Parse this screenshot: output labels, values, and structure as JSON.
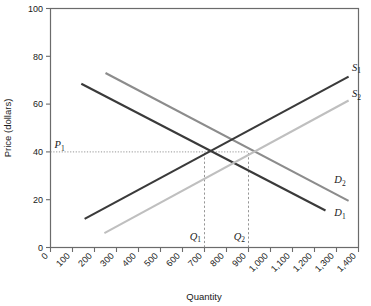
{
  "chart_data": {
    "type": "line",
    "title": "",
    "xlabel": "Quantity",
    "ylabel": "Price (dollars)",
    "xlim": [
      0,
      1400
    ],
    "ylim": [
      0,
      100
    ],
    "grid": false,
    "legend_position": "inline-end-labels",
    "x_ticks": [
      0,
      100,
      200,
      300,
      400,
      500,
      600,
      700,
      800,
      900,
      1000,
      1100,
      1200,
      1300,
      1400
    ],
    "x_tick_labels": [
      "0",
      "100",
      "200",
      "300",
      "400",
      "500",
      "600",
      "700",
      "800",
      "900",
      "1,000",
      "1,100",
      "1,200",
      "1,300",
      "1,400"
    ],
    "y_ticks": [
      0,
      20,
      40,
      60,
      80,
      100
    ],
    "y_tick_labels": [
      "0",
      "20",
      "40",
      "60",
      "80",
      "100"
    ],
    "series": [
      {
        "name": "D1",
        "label": "D",
        "subscript": "1",
        "role": "demand-original",
        "color": "#3a3a3a",
        "width": 2.1,
        "points": [
          [
            140,
            68.5
          ],
          [
            1250,
            15.5
          ]
        ],
        "label_x": 1290,
        "label_y": 13
      },
      {
        "name": "D2",
        "label": "D",
        "subscript": "2",
        "role": "demand-shifted",
        "color": "#8c8c8c",
        "width": 2.1,
        "points": [
          [
            250,
            73.0
          ],
          [
            1355,
            19.5
          ]
        ],
        "label_x": 1290,
        "label_y": 27
      },
      {
        "name": "S1",
        "label": "S",
        "subscript": "1",
        "role": "supply-original",
        "color": "#3a3a3a",
        "width": 2.1,
        "points": [
          [
            155,
            12.0
          ],
          [
            1355,
            71.5
          ]
        ],
        "label_x": 1370,
        "label_y": 74
      },
      {
        "name": "S2",
        "label": "S",
        "subscript": "2",
        "role": "supply-shifted",
        "color": "#bfbfbf",
        "width": 2.1,
        "points": [
          [
            245,
            6.0
          ],
          [
            1355,
            61.5
          ]
        ],
        "label_x": 1370,
        "label_y": 63
      }
    ],
    "reference_lines": [
      {
        "name": "P1",
        "label": "P",
        "subscript": "1",
        "orientation": "horizontal",
        "value": 40,
        "from": 0,
        "to": 900,
        "style": "dotted"
      },
      {
        "name": "Q1",
        "label": "Q",
        "subscript": "1",
        "orientation": "vertical",
        "value": 700,
        "from": 0,
        "to": 40,
        "style": "dashed"
      },
      {
        "name": "Q2",
        "label": "Q",
        "subscript": "2",
        "orientation": "vertical",
        "value": 900,
        "from": 0,
        "to": 40,
        "style": "dashed"
      }
    ],
    "equilibria": [
      {
        "name": "E1",
        "quantity": 700,
        "price": 40
      },
      {
        "name": "E2",
        "quantity": 900,
        "price": 40
      }
    ],
    "colors": {
      "axis": "#6b6b6b",
      "text": "#1a1a1a",
      "dashed": "#8a8a8a",
      "background": "#ffffff"
    }
  }
}
